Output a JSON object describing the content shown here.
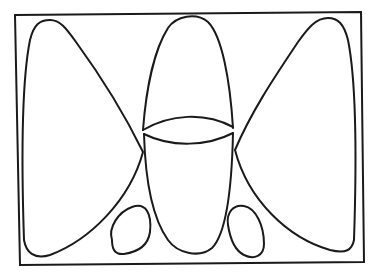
{
  "figure": {
    "type": "line-drawing",
    "colors": {
      "background": "#ffffff",
      "stroke": "#1a1a1a"
    },
    "shapes": [
      {
        "id": "frame",
        "kind": "rectangle"
      },
      {
        "id": "left-wing",
        "kind": "closed-curve"
      },
      {
        "id": "center-upper-lobe",
        "kind": "closed-curve"
      },
      {
        "id": "center-lens",
        "kind": "lens"
      },
      {
        "id": "center-lower-lobe",
        "kind": "closed-curve"
      },
      {
        "id": "right-wing",
        "kind": "closed-curve"
      },
      {
        "id": "left-small-blob",
        "kind": "closed-curve"
      },
      {
        "id": "right-small-blob",
        "kind": "closed-curve"
      }
    ]
  }
}
